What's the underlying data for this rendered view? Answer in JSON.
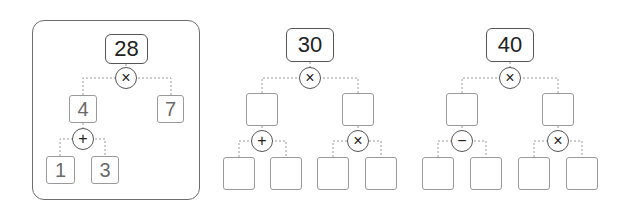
{
  "trees": [
    {
      "label": "example",
      "root": "28",
      "root_op": "×",
      "mid": [
        "4",
        "7"
      ],
      "left_op": "+",
      "leaves": [
        "1",
        "3"
      ]
    },
    {
      "root": "30",
      "root_op": "×",
      "mid": [
        "",
        ""
      ],
      "left_op": "+",
      "right_op": "×",
      "leaves": [
        "",
        "",
        "",
        ""
      ]
    },
    {
      "root": "40",
      "root_op": "×",
      "mid": [
        "",
        ""
      ],
      "left_op": "−",
      "right_op": "×",
      "leaves": [
        "",
        "",
        "",
        ""
      ]
    }
  ],
  "colors": {
    "root_border": "#555555",
    "box_border": "#9a9a9a",
    "dashed": "#9a9a9a",
    "frame": "#6e6e6e"
  }
}
